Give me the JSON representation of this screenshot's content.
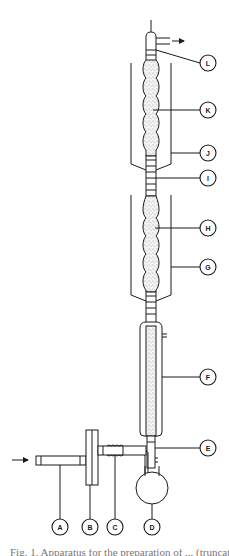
{
  "figure": {
    "type": "apparatus-schematic",
    "flow_in_arrow": "arrow-right-icon",
    "flow_out_arrow": "arrow-right-icon",
    "colors": {
      "line": "#1a1a1a",
      "background": "#ffffff"
    }
  },
  "labels": [
    {
      "id": "A",
      "text": "A",
      "part": "inlet-tube"
    },
    {
      "id": "B",
      "text": "B",
      "part": "flange-fitting"
    },
    {
      "id": "C",
      "text": "C",
      "part": "heated-coil-connector"
    },
    {
      "id": "D",
      "text": "D",
      "part": "round-bottom-flask"
    },
    {
      "id": "E",
      "text": "E",
      "part": "side-arm-junction"
    },
    {
      "id": "F",
      "text": "F",
      "part": "packed-tube"
    },
    {
      "id": "G",
      "text": "G",
      "part": "lower-jacket"
    },
    {
      "id": "H",
      "text": "H",
      "part": "lower-bulb-column"
    },
    {
      "id": "I",
      "text": "I",
      "part": "ring-section"
    },
    {
      "id": "J",
      "text": "J",
      "part": "upper-jacket"
    },
    {
      "id": "K",
      "text": "K",
      "part": "upper-bulb-column"
    },
    {
      "id": "L",
      "text": "L",
      "part": "outlet-head"
    }
  ],
  "caption": {
    "text": "Fig. 1. Apparatus for the preparation of ... (truncated)"
  }
}
